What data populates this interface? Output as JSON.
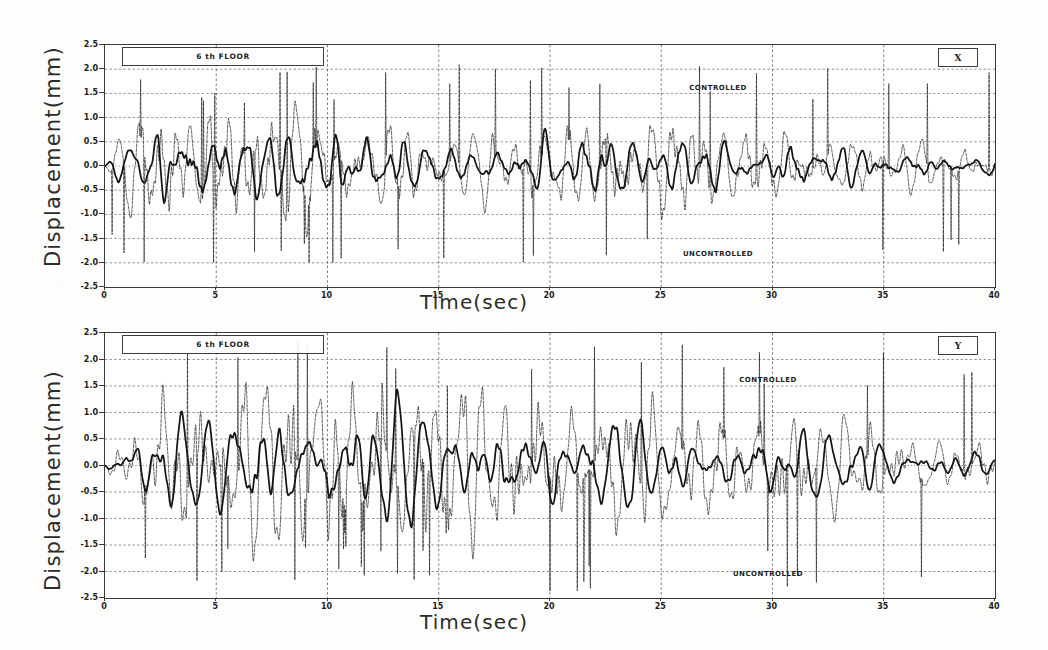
{
  "figure": {
    "panels": [
      {
        "id": "panel-x",
        "floor_label": "6 th FLOOR",
        "direction_label": "X",
        "ylabel": "Displacement(mm)",
        "xlabel": "Time(sec)",
        "annotations": [
          {
            "name": "controlled",
            "text": "CONTROLLED"
          },
          {
            "name": "uncontrolled",
            "text": "UNCONTROLLED"
          }
        ]
      },
      {
        "id": "panel-y",
        "floor_label": "6 th FLOOR",
        "direction_label": "Y",
        "ylabel": "Displacement(mm)",
        "xlabel": "Time(sec)",
        "annotations": [
          {
            "name": "controlled",
            "text": "CONTROLLED"
          },
          {
            "name": "uncontrolled",
            "text": "UNCONTROLLED"
          }
        ]
      }
    ]
  },
  "chart_data": [
    {
      "type": "line",
      "id": "panel-x",
      "title": "6 th FLOOR",
      "direction": "X",
      "xlabel": "Time(sec)",
      "ylabel": "Displacement(mm)",
      "xlim": [
        0,
        40
      ],
      "ylim": [
        -2.5,
        2.5
      ],
      "xticks": [
        0,
        5,
        10,
        15,
        20,
        25,
        30,
        35,
        40
      ],
      "xtick_labels": [
        "0",
        "5",
        "10",
        "15",
        "20",
        "25",
        "30",
        "35",
        "40"
      ],
      "yticks": [
        2.5,
        2.0,
        1.5,
        1.0,
        0.5,
        0.0,
        -0.5,
        -1.0,
        -1.5,
        -2.0,
        -2.5
      ],
      "ytick_labels": [
        "2.5",
        "2.0",
        "1.5",
        "1.0",
        "0.5",
        "0.0",
        "-0.5",
        "-1.0",
        "-1.5",
        "-2.0",
        "-2.5"
      ],
      "grid": true,
      "grid_style": "dotted",
      "legend_position": "inline-annotation",
      "series": [
        {
          "name": "UNCONTROLLED",
          "style": "thin",
          "color": "#1d1d1d",
          "peak_positive": 2.1,
          "peak_negative": -1.9,
          "rms": 0.62,
          "seed": 1771,
          "params": {
            "base_freq": 1.05,
            "env": "early-strong-decay",
            "jitter": 0.55,
            "amp": 1.25
          }
        },
        {
          "name": "CONTROLLED",
          "style": "bold",
          "color": "#151515",
          "peak_positive": 1.35,
          "peak_negative": -1.25,
          "rms": 0.38,
          "seed": 4231,
          "params": {
            "base_freq": 1.05,
            "env": "early-strong-decay",
            "jitter": 0.22,
            "amp": 0.78
          }
        }
      ]
    },
    {
      "type": "line",
      "id": "panel-y",
      "title": "6 th FLOOR",
      "direction": "Y",
      "xlabel": "Time(sec)",
      "ylabel": "Displacement(mm)",
      "xlim": [
        0,
        40
      ],
      "ylim": [
        -2.5,
        2.5
      ],
      "xticks": [
        0,
        5,
        10,
        15,
        20,
        25,
        30,
        35,
        40
      ],
      "xtick_labels": [
        "0",
        "5",
        "10",
        "15",
        "20",
        "25",
        "30",
        "35",
        "40"
      ],
      "yticks": [
        2.5,
        2.0,
        1.5,
        1.0,
        0.5,
        0.0,
        -0.5,
        -1.0,
        -1.5,
        -2.0,
        -2.5
      ],
      "ytick_labels": [
        "2.5",
        "2.0",
        "1.5",
        "1.0",
        "0.5",
        "0.0",
        "-0.5",
        "-1.0",
        "-1.5",
        "-2.0",
        "-2.5"
      ],
      "grid": true,
      "grid_style": "dotted",
      "legend_position": "inline-annotation",
      "series": [
        {
          "name": "UNCONTROLLED",
          "style": "thin",
          "color": "#1d1d1d",
          "peak_positive": 2.25,
          "peak_negative": -2.4,
          "rms": 0.74,
          "seed": 9109,
          "params": {
            "base_freq": 0.85,
            "env": "mid-strong",
            "jitter": 0.6,
            "amp": 1.45
          }
        },
        {
          "name": "CONTROLLED",
          "style": "bold",
          "color": "#151515",
          "peak_positive": 1.95,
          "peak_negative": -1.7,
          "rms": 0.45,
          "seed": 3307,
          "params": {
            "base_freq": 0.85,
            "env": "mid-strong",
            "jitter": 0.25,
            "amp": 0.85
          }
        }
      ]
    }
  ]
}
